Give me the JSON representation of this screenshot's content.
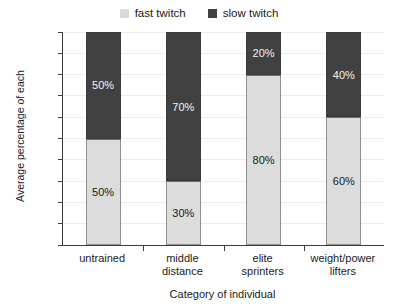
{
  "chart_data": {
    "type": "bar",
    "stacked": true,
    "title": "",
    "xlabel": "Category of individual",
    "ylabel": "Average percentage of each",
    "ylim": [
      0,
      100
    ],
    "yticks": [
      "0%",
      "10%",
      "20%",
      "30%",
      "40%",
      "50%",
      "60%",
      "70%",
      "80%",
      "90%",
      "100%"
    ],
    "ytick_values": [
      0,
      10,
      20,
      30,
      40,
      50,
      60,
      70,
      80,
      90,
      100
    ],
    "grid": true,
    "legend_position": "top-center",
    "categories": [
      "untrained",
      "middle distance",
      "elite sprinters",
      "weight/power lifters"
    ],
    "category_lines": [
      [
        "untrained"
      ],
      [
        "middle",
        "distance"
      ],
      [
        "elite",
        "sprinters"
      ],
      [
        "weight/power",
        "lifters"
      ]
    ],
    "series": [
      {
        "name": "fast twitch",
        "color": "#dcdcdc",
        "values": [
          50,
          30,
          80,
          60
        ],
        "labels": [
          "50%",
          "30%",
          "80%",
          "60%"
        ]
      },
      {
        "name": "slow twitch",
        "color": "#414141",
        "values": [
          50,
          70,
          20,
          40
        ],
        "labels": [
          "50%",
          "70%",
          "20%",
          "40%"
        ]
      }
    ]
  },
  "legend": {
    "entries": [
      {
        "label": "fast twitch",
        "swatch": "fast-twitch-swatch"
      },
      {
        "label": "slow twitch",
        "swatch": "slow-twitch-swatch"
      }
    ]
  },
  "axes": {
    "y_title": "Average percentage of each",
    "x_title": "Category of individual"
  },
  "colors": {
    "fast_twitch": "#dcdcdc",
    "slow_twitch": "#414141",
    "axis": "#3d3d3d",
    "gridline": "#ececec",
    "background": "#ffffff"
  }
}
